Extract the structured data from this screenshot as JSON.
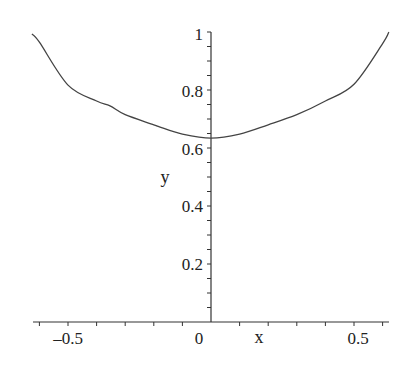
{
  "chart_data": {
    "type": "line",
    "title": "",
    "xlabel": "x",
    "ylabel": "y",
    "xlim": [
      -0.626,
      0.622
    ],
    "ylim": [
      0,
      1
    ],
    "grid": false,
    "legend": null,
    "x_ticks": [
      {
        "value": -0.5,
        "label": "-0.5"
      },
      {
        "value": 0,
        "label": "0"
      },
      {
        "value": 0.5,
        "label": "0.5"
      }
    ],
    "y_ticks": [
      {
        "value": 0.2,
        "label": "0.2"
      },
      {
        "value": 0.4,
        "label": "0.4"
      },
      {
        "value": 0.6,
        "label": "0.6"
      },
      {
        "value": 0.8,
        "label": "0.8"
      },
      {
        "value": 1,
        "label": "1"
      }
    ],
    "series": [
      {
        "name": "y(x)",
        "color": "#444444",
        "x": [
          -0.626,
          -0.6,
          -0.5,
          -0.4,
          -0.353,
          -0.3,
          -0.2,
          -0.178,
          -0.1,
          0,
          0.1,
          0.2,
          0.3,
          0.4,
          0.5,
          0.6,
          0.622
        ],
        "y": [
          0.993,
          0.965,
          0.817,
          0.762,
          0.745,
          0.715,
          0.68,
          0.672,
          0.648,
          0.634,
          0.648,
          0.68,
          0.715,
          0.762,
          0.82,
          0.96,
          1.0
        ]
      }
    ]
  },
  "axes": {
    "x_label": "x",
    "y_label": "y",
    "x_tick_labels": [
      "-0.5",
      "0",
      "0.5"
    ],
    "y_tick_labels": [
      "0.2",
      "0.4",
      "0.6",
      "0.8",
      "1"
    ]
  }
}
